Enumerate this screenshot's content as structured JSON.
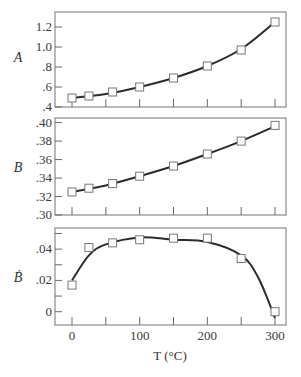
{
  "chart_data": [
    {
      "type": "line",
      "panel": "A",
      "ylabel": "A",
      "xlabel": "",
      "x": [
        0,
        25,
        60,
        100,
        150,
        200,
        250,
        300
      ],
      "series": [
        {
          "name": "A measured",
          "style": "square-markers",
          "values": [
            0.49,
            0.51,
            0.55,
            0.6,
            0.69,
            0.81,
            0.97,
            1.25
          ]
        },
        {
          "name": "A fit",
          "style": "line",
          "x": [
            0,
            50,
            100,
            150,
            200,
            250,
            300
          ],
          "values": [
            0.49,
            0.53,
            0.6,
            0.69,
            0.81,
            0.98,
            1.25
          ]
        }
      ],
      "ylim": [
        0.4,
        1.35
      ],
      "yticks": [
        0.4,
        0.6,
        0.8,
        1.0,
        1.2
      ],
      "ytick_labels": [
        ".4",
        ".6",
        ".8",
        "1.0",
        "1.2"
      ],
      "grid": false
    },
    {
      "type": "line",
      "panel": "B",
      "ylabel": "B",
      "xlabel": "",
      "x": [
        0,
        25,
        60,
        100,
        150,
        200,
        250,
        300
      ],
      "series": [
        {
          "name": "B measured",
          "style": "square-markers",
          "values": [
            0.325,
            0.329,
            0.334,
            0.342,
            0.353,
            0.366,
            0.38,
            0.397
          ]
        },
        {
          "name": "B fit",
          "style": "line",
          "x": [
            0,
            50,
            100,
            150,
            200,
            250,
            300
          ],
          "values": [
            0.325,
            0.332,
            0.342,
            0.353,
            0.366,
            0.38,
            0.396
          ]
        }
      ],
      "ylim": [
        0.3,
        0.405
      ],
      "yticks": [
        0.3,
        0.32,
        0.34,
        0.36,
        0.38,
        0.4
      ],
      "ytick_labels": [
        ".30",
        ".32",
        ".34",
        ".36",
        ".38",
        ".40"
      ],
      "grid": false
    },
    {
      "type": "line",
      "panel": "B-dot",
      "ylabel": "Ḃ",
      "xlabel": "T (°C)",
      "x": [
        0,
        25,
        60,
        100,
        150,
        200,
        250,
        300
      ],
      "series": [
        {
          "name": "B-dot measured",
          "style": "square-markers",
          "values": [
            0.017,
            0.041,
            0.044,
            0.046,
            0.047,
            0.047,
            0.034,
            0.0
          ]
        },
        {
          "name": "B-dot fit",
          "style": "line",
          "x": [
            0,
            25,
            50,
            100,
            150,
            200,
            250,
            275,
            300
          ],
          "values": [
            0.02,
            0.036,
            0.043,
            0.0475,
            0.046,
            0.0445,
            0.036,
            0.022,
            -0.004
          ]
        }
      ],
      "ylim": [
        -0.0085,
        0.0535
      ],
      "yticks": [
        0,
        0.01,
        0.02,
        0.03,
        0.04,
        0.05
      ],
      "ytick_labels": [
        "0",
        "",
        ".02",
        "",
        ".04",
        ""
      ],
      "grid": false
    }
  ],
  "axes": {
    "x_ticks": [
      0,
      50,
      100,
      150,
      200,
      250,
      300
    ],
    "x_tick_labels": [
      "0",
      "",
      "100",
      "",
      "200",
      "",
      "300"
    ],
    "xlim": [
      -25,
      316
    ],
    "xlabel": "T (°C)"
  },
  "labels": {
    "panel_a": "A",
    "panel_b": "B",
    "panel_c": "Ḃ",
    "x_axis": "T (°C)"
  }
}
